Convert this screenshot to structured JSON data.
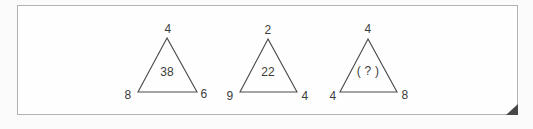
{
  "panel": {
    "background": "#fefefe",
    "border_color": "#b2b2b2",
    "fold_color": "#474747"
  },
  "figure": {
    "ink_color": "#4a4a4a",
    "description_icons": [
      "folded-corner-icon"
    ]
  },
  "triangles": [
    {
      "top": "4",
      "center": "38",
      "bottom_left": "8",
      "bottom_right": "6"
    },
    {
      "top": "2",
      "center": "22",
      "bottom_left": "9",
      "bottom_right": "4"
    },
    {
      "top": "4",
      "center": "( ? )",
      "bottom_left": "4",
      "bottom_right": "8"
    }
  ]
}
